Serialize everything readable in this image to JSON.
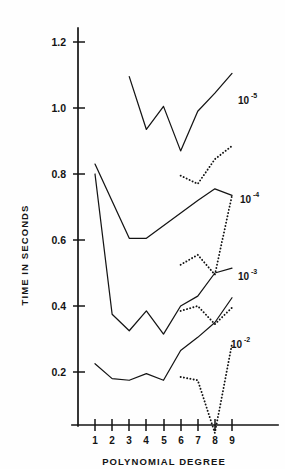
{
  "chart_data": {
    "type": "line",
    "title": "",
    "xlabel": "POLYNOMIAL DEGREE",
    "ylabel": "TIME IN SECONDS",
    "xlim": [
      0,
      10
    ],
    "ylim": [
      0,
      1.3
    ],
    "grid": false,
    "legend_position": "inline-right",
    "x_tick_labels": [
      "1",
      "2",
      "3",
      "4",
      "5",
      "6",
      "7",
      "8",
      "9"
    ],
    "x_ticks": [
      1,
      2,
      3,
      4,
      5,
      6,
      7,
      8,
      9
    ],
    "y_tick_labels": [
      "0.2",
      "0.4",
      "0.6",
      "0.8",
      "1.0",
      "1.2"
    ],
    "y_ticks": [
      0.2,
      0.4,
      0.6,
      0.8,
      1.0,
      1.2
    ],
    "annotations": [
      {
        "text": "10",
        "exponent": "-5",
        "x": 9.55,
        "y": 1.015
      },
      {
        "text": "10",
        "exponent": "-4",
        "x": 9.6,
        "y": 0.715
      },
      {
        "text": "10",
        "exponent": "-3",
        "x": 9.55,
        "y": 0.482
      },
      {
        "text": "10",
        "exponent": "-2",
        "x": 9.35,
        "y": 0.275
      }
    ],
    "series": [
      {
        "name": "10^-5 solid",
        "label": "10-5",
        "style": "solid",
        "x": [
          3,
          4,
          5,
          6,
          7,
          8,
          9
        ],
        "values": [
          1.095,
          0.935,
          1.005,
          0.87,
          0.99,
          1.045,
          1.105
        ]
      },
      {
        "name": "10^-5 dotted",
        "label": "10-5",
        "style": "dotted",
        "x": [
          6,
          7,
          8,
          9
        ],
        "values": [
          0.795,
          0.77,
          0.845,
          0.885
        ]
      },
      {
        "name": "10^-4 solid",
        "label": "10-4",
        "style": "solid",
        "x": [
          1,
          3,
          4,
          7,
          8,
          9
        ],
        "values": [
          0.83,
          0.605,
          0.605,
          0.72,
          0.755,
          0.735
        ]
      },
      {
        "name": "10^-4 dotted",
        "label": "10-4",
        "style": "dotted",
        "x": [
          6,
          7,
          8,
          9
        ],
        "values": [
          0.525,
          0.555,
          0.495,
          0.735
        ]
      },
      {
        "name": "10^-3 solid",
        "label": "10-3",
        "style": "solid",
        "x": [
          1,
          2,
          3,
          4,
          5,
          6,
          7,
          8,
          9
        ],
        "values": [
          0.8,
          0.375,
          0.325,
          0.385,
          0.315,
          0.4,
          0.43,
          0.5,
          0.515
        ]
      },
      {
        "name": "10^-3 dotted",
        "label": "10-3",
        "style": "dotted",
        "x": [
          6,
          7,
          8,
          9
        ],
        "values": [
          0.385,
          0.4,
          0.345,
          0.395
        ]
      },
      {
        "name": "10^-2 solid",
        "label": "10-2",
        "style": "solid",
        "x": [
          1,
          2,
          3,
          4,
          5,
          6,
          7,
          8,
          9
        ],
        "values": [
          0.225,
          0.18,
          0.175,
          0.195,
          0.175,
          0.265,
          0.305,
          0.35,
          0.425
        ]
      },
      {
        "name": "10^-2 dotted",
        "label": "10-2",
        "style": "dotted",
        "x": [
          6,
          7,
          8,
          9
        ],
        "values": [
          0.185,
          0.175,
          0.015,
          0.285
        ]
      }
    ]
  },
  "axes": {
    "y_axis_title": "TIME IN SECONDS",
    "x_axis_title": "POLYNOMIAL DEGREE"
  },
  "ticks": {
    "y": [
      "1.2",
      "1.0",
      "0.8",
      "0.6",
      "0.4",
      "0.2"
    ],
    "x": [
      "1",
      "2",
      "3",
      "4",
      "5",
      "6",
      "7",
      "8",
      "9"
    ]
  },
  "labels": {
    "s1_base": "10",
    "s1_exp": "-5",
    "s2_base": "10",
    "s2_exp": "-4",
    "s3_base": "10",
    "s3_exp": "-3",
    "s4_base": "10",
    "s4_exp": "-2"
  },
  "colors": {
    "ink": "#141414",
    "background": "#fefefe"
  }
}
